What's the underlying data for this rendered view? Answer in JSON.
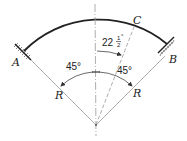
{
  "diagram": {
    "labels": {
      "A": "A",
      "B": "B",
      "C": "C",
      "R_left": "R",
      "R_right": "R"
    },
    "angles": {
      "left": "45°",
      "right": "45°",
      "c_whole": "22",
      "c_num": "1",
      "c_den": "2",
      "c_deg": "°"
    },
    "colors": {
      "arc": "#222222",
      "lines": "#888888"
    }
  }
}
